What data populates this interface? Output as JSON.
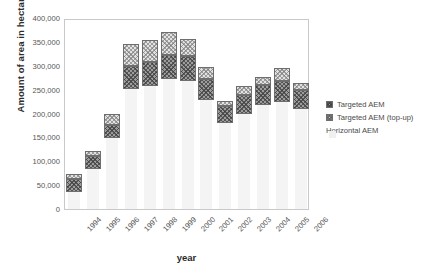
{
  "chart_data": {
    "type": "bar",
    "stacked": true,
    "title": "",
    "xlabel": "year",
    "ylabel": "Amount of area in hectares",
    "categories": [
      "1994",
      "1995",
      "1996",
      "1997",
      "1998",
      "1999",
      "2000",
      "2001",
      "2002",
      "2003",
      "2004",
      "2005",
      "2006"
    ],
    "ylim": [
      0,
      400000
    ],
    "ytick_values": [
      0,
      50000,
      100000,
      150000,
      200000,
      250000,
      300000,
      350000,
      400000
    ],
    "ytick_labels": [
      "0",
      "50,000",
      "100,000",
      "150,000",
      "200,000",
      "250,000",
      "300,000",
      "350,000",
      "400,000"
    ],
    "grid": false,
    "legend_position": "right",
    "series": [
      {
        "name": "Horizontal AEM",
        "values": [
          0,
          0,
          0,
          0,
          0,
          0,
          0,
          0,
          0,
          0,
          0,
          0,
          0
        ]
      },
      {
        "name": "Targeted AEM",
        "values": [
          63000,
          110000,
          176000,
          300000,
          307000,
          323000,
          320000,
          272000,
          215000,
          238000,
          260000,
          268000,
          250000
        ]
      },
      {
        "name": "Targeted AEM (top-up)",
        "values": [
          3000,
          6000,
          24000,
          45000,
          48000,
          47000,
          37000,
          25000,
          7000,
          19000,
          17000,
          27000,
          13000
        ]
      }
    ],
    "totals": [
      66000,
      116000,
      200000,
      345000,
      355000,
      370000,
      357000,
      297000,
      222000,
      257000,
      277000,
      295000,
      263000
    ],
    "legend_entries": [
      {
        "label": "Targeted AEM",
        "swatch": "targeted"
      },
      {
        "label": "Targeted AEM (top-up)",
        "swatch": "topup"
      },
      {
        "label": "Horizontal AEM",
        "swatch": "horiz"
      }
    ],
    "colors": {
      "targeted": "#9d9d9d",
      "topup": "#e2e2e2",
      "horizontal": "#f4f4f4",
      "outline": "#6e6e6e",
      "frame": "#c9c9c9",
      "text": "#555555"
    }
  }
}
